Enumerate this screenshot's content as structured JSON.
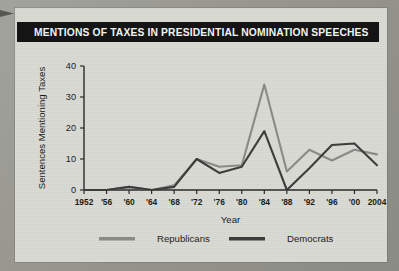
{
  "title": "MENTIONS OF TAXES IN PRESIDENTIAL NOMINATION SPEECHES",
  "colors": {
    "title_bar_bg": "#141414",
    "title_text": "#f2f2f0",
    "panel_bg": "#d9d9d4",
    "republicans": "#8a8a86",
    "democrats": "#3d3d3b",
    "axis": "#2a2a2a"
  },
  "legend": {
    "position": "bottom",
    "entries": [
      {
        "label": "Republicans",
        "color": "#8a8a86"
      },
      {
        "label": "Democrats",
        "color": "#3d3d3b"
      }
    ]
  },
  "chart_data": {
    "type": "line",
    "title": "MENTIONS OF TAXES IN PRESIDENTIAL NOMINATION SPEECHES",
    "xlabel": "Year",
    "ylabel": "Sentences Mentioning Taxes",
    "x": [
      1952,
      1956,
      1960,
      1964,
      1968,
      1972,
      1976,
      1980,
      1984,
      1988,
      1992,
      1996,
      2000,
      2004
    ],
    "xtick_labels": [
      "1952",
      "'56",
      "'60",
      "'64",
      "'68",
      "'72",
      "'76",
      "'80",
      "'84",
      "'88",
      "'92",
      "'96",
      "'00",
      "2004"
    ],
    "ytick_labels": [
      "0",
      "10",
      "20",
      "30",
      "40"
    ],
    "yticks": [
      0,
      10,
      20,
      30,
      40
    ],
    "ylim": [
      0,
      40
    ],
    "xlim": [
      1952,
      2004
    ],
    "grid": false,
    "series": [
      {
        "name": "Republicans",
        "color": "#8a8a86",
        "values": [
          0,
          0,
          1,
          0,
          1.5,
          10,
          7.5,
          8,
          34,
          6,
          13,
          9.5,
          13,
          11.5
        ]
      },
      {
        "name": "Democrats",
        "color": "#3d3d3b",
        "values": [
          0,
          0,
          1,
          0,
          1,
          10,
          5.5,
          7.5,
          19,
          0,
          7,
          14.5,
          15,
          8
        ]
      }
    ]
  }
}
